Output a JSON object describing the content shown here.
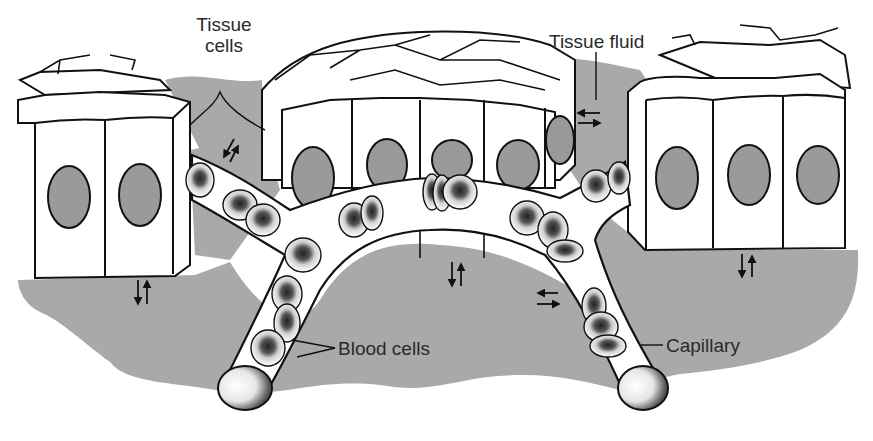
{
  "diagram": {
    "type": "anatomical-illustration",
    "colors": {
      "background": "#ffffff",
      "tissue_fluid": "#a9a9a9",
      "nucleus": "#9a9a9a",
      "cell_fill": "#ffffff",
      "outline": "#111111",
      "label_text": "#2a2a2a"
    },
    "labels": {
      "tissue_cells": [
        "Tissue",
        "cells"
      ],
      "tissue_fluid": "Tissue fluid",
      "blood_cells": "Blood cells",
      "capillary": "Capillary"
    },
    "cell_groups": [
      {
        "name": "left-tissue-cells",
        "visible_cells": 2,
        "nuclei": 2
      },
      {
        "name": "middle-tissue-cells",
        "visible_cells": 4,
        "nuclei": 5
      },
      {
        "name": "right-tissue-cells",
        "visible_cells": 3,
        "nuclei": 3
      }
    ],
    "exchange_arrows": [
      {
        "location": "left-upper",
        "direction": "bidirectional-diagonal"
      },
      {
        "location": "left-cells-base",
        "direction": "bidirectional-vertical"
      },
      {
        "location": "middle-right-top",
        "direction": "bidirectional-horizontal"
      },
      {
        "location": "middle-arch-base",
        "direction": "bidirectional-vertical"
      },
      {
        "location": "right-capillary-side",
        "direction": "bidirectional-horizontal"
      },
      {
        "location": "right-cells-base",
        "direction": "bidirectional-vertical"
      }
    ]
  }
}
